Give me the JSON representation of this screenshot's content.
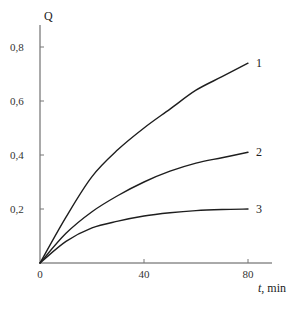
{
  "chart_data": {
    "type": "line",
    "title": "",
    "xlabel": "t, min",
    "xlabel_var": "t",
    "xlabel_unit": ", min",
    "ylabel": "Q",
    "xlim": [
      0,
      88
    ],
    "ylim": [
      0,
      0.9
    ],
    "grid": false,
    "legend_position": "inline labels at curve ends",
    "x_ticks": [
      0,
      40,
      80
    ],
    "x_tick_labels": [
      "0",
      "40",
      "80"
    ],
    "y_ticks": [
      0.2,
      0.4,
      0.6,
      0.8
    ],
    "y_tick_labels": [
      "0,2",
      "0,4",
      "0,6",
      "0,8"
    ],
    "x": [
      0,
      10,
      20,
      30,
      40,
      50,
      60,
      70,
      80
    ],
    "series": [
      {
        "name": "1",
        "values": [
          0,
          0.17,
          0.32,
          0.42,
          0.5,
          0.57,
          0.64,
          0.69,
          0.74
        ]
      },
      {
        "name": "2",
        "values": [
          0,
          0.11,
          0.19,
          0.25,
          0.3,
          0.34,
          0.37,
          0.39,
          0.41
        ]
      },
      {
        "name": "3",
        "values": [
          0,
          0.08,
          0.13,
          0.155,
          0.174,
          0.186,
          0.194,
          0.198,
          0.2
        ]
      }
    ]
  }
}
